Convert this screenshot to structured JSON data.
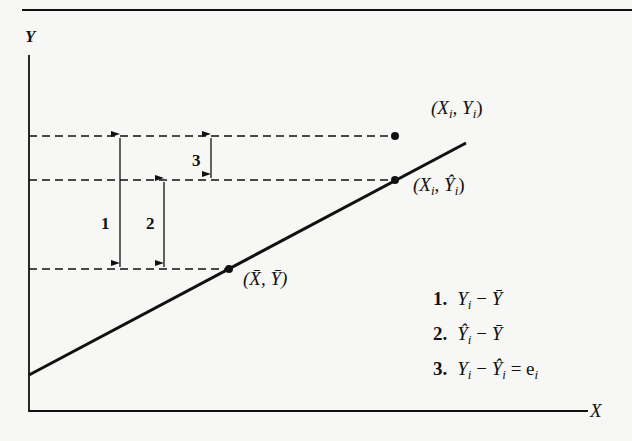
{
  "diagram": {
    "type": "regression-deviation-decomposition",
    "axes": {
      "x_label": "X",
      "y_label": "Y"
    },
    "points": [
      {
        "id": "observed",
        "label_main": "(X",
        "sub1": "i",
        "label_mid": ", Y",
        "sub2": "i",
        "label_end": ")",
        "description": "(Xi, Yi)"
      },
      {
        "id": "fitted",
        "label_main": "(X",
        "sub1": "i",
        "label_mid": ", Ŷ",
        "sub2": "i",
        "label_end": ")",
        "description": "(Xi, Ŷi)"
      },
      {
        "id": "mean",
        "label_main": "(X̄, Ȳ)",
        "description": "(X̄, Ȳ)"
      }
    ],
    "segments": [
      {
        "number": "1",
        "label": "1"
      },
      {
        "number": "2",
        "label": "2"
      },
      {
        "number": "3",
        "label": "3"
      }
    ],
    "legend": [
      {
        "num": "1.",
        "expr": "Yi − Ȳ",
        "a": "Y",
        "a_sub": "i",
        "op": " − ",
        "b": "Ȳ",
        "rest": ""
      },
      {
        "num": "2.",
        "expr": "Ŷi − Ȳ",
        "a": "Ŷ",
        "a_sub": "i",
        "op": " − ",
        "b": "Ȳ",
        "rest": ""
      },
      {
        "num": "3.",
        "expr": "Yi − Ŷi = ei",
        "a": "Y",
        "a_sub": "i",
        "op": " − ",
        "b": "Ŷ",
        "b_sub": "i",
        "rest": " = e",
        "rest_sub": "i"
      }
    ]
  },
  "colors": {
    "ink": "#111111",
    "paper": "#f7f7f5"
  }
}
